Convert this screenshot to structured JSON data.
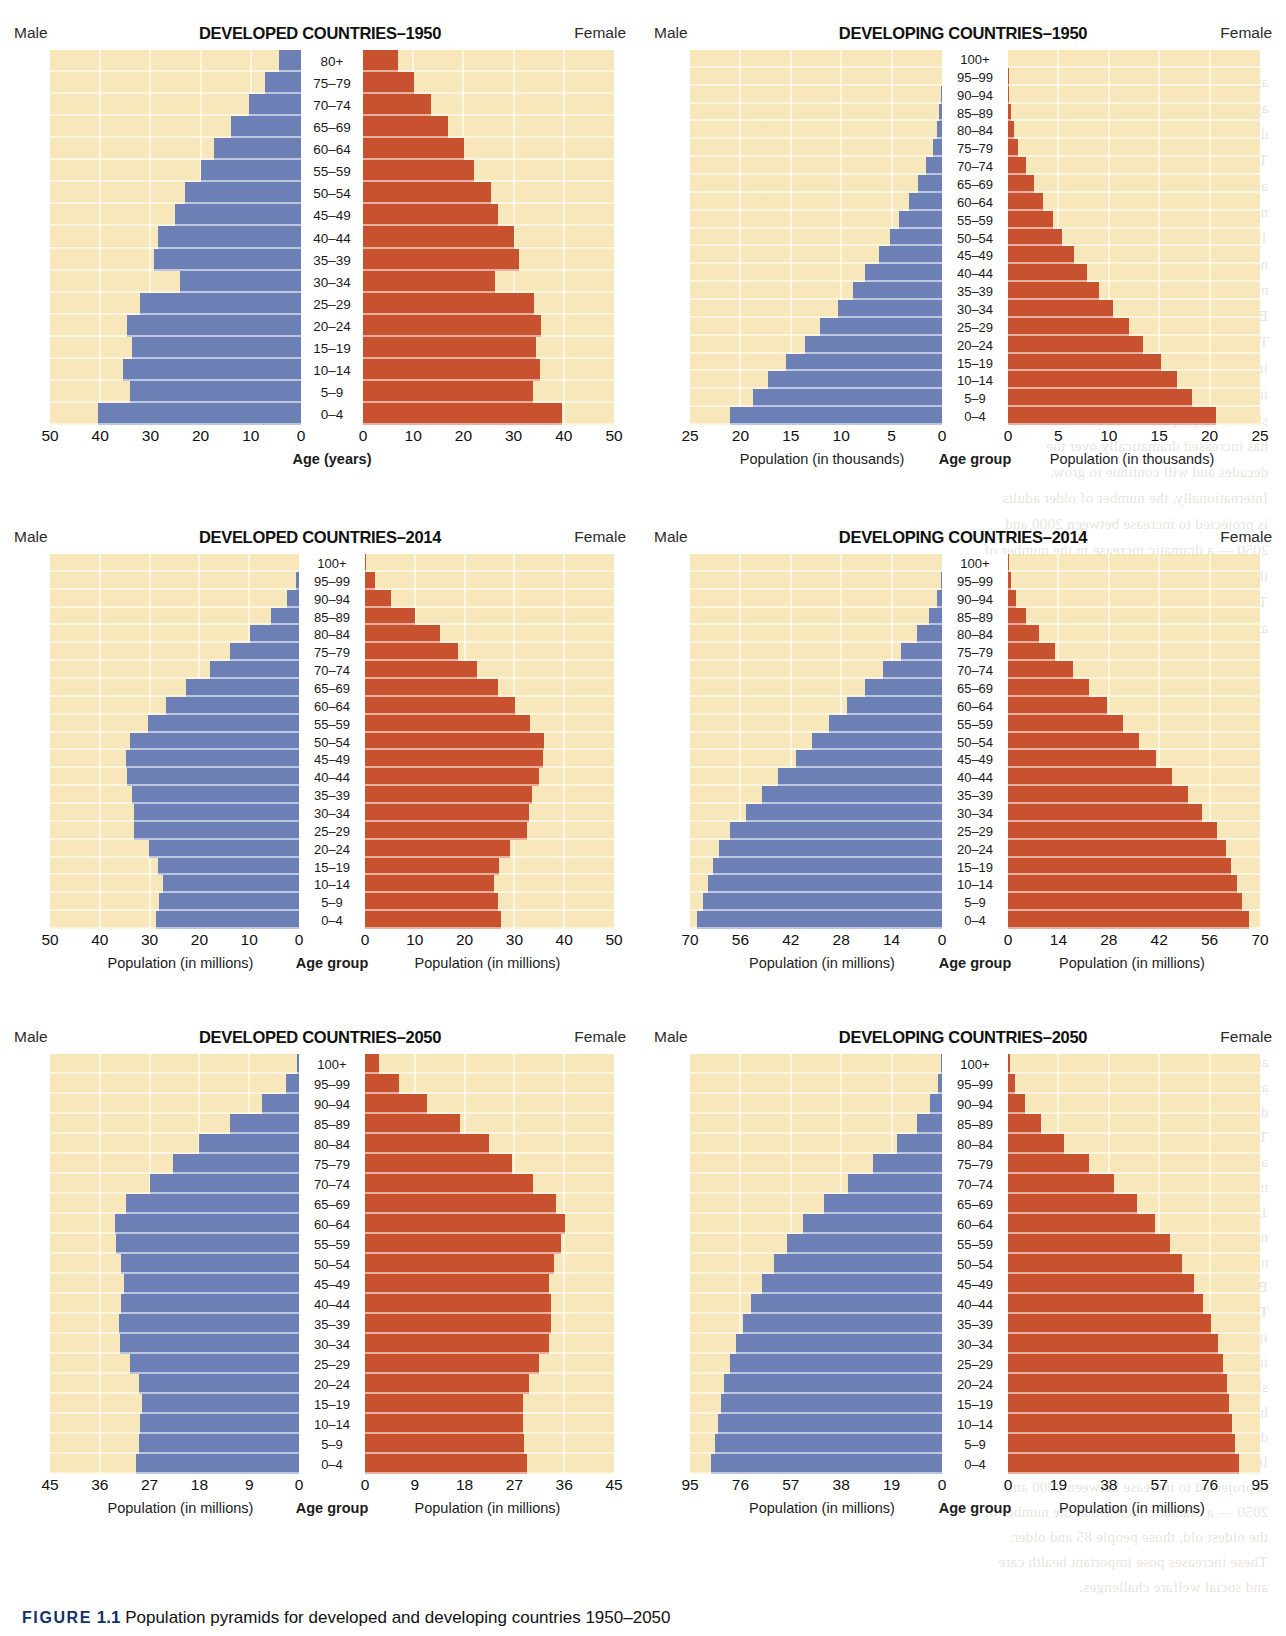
{
  "figure": {
    "label": "FIGURE",
    "number": "1.1",
    "caption": "Population pyramids for developed and developing countries 1950–2050"
  },
  "colors": {
    "male_bar": "#6c80b6",
    "female_bar": "#c8522f",
    "plot_background": "#f7e6b8",
    "gridline": "#fdf7e2",
    "age_column": "#ffffff"
  },
  "common": {
    "male_label": "Male",
    "female_label": "Female",
    "age_group_label": "Age group"
  },
  "chart_data": [
    {
      "id": "developed-1950",
      "type": "bar",
      "title": "DEVELOPED COUNTRIES–1950",
      "subtype": "population-pyramid",
      "left_label": "Male",
      "right_label": "Female",
      "center_axis_label": "Age (years)",
      "xlabel_left": "",
      "xlabel_right": "",
      "units": "",
      "xlim": [
        0,
        50
      ],
      "xticks": [
        50,
        40,
        30,
        20,
        10,
        0
      ],
      "xticks_right": [
        0,
        10,
        20,
        30,
        40,
        50
      ],
      "grid": true,
      "categories": [
        "80+",
        "75–79",
        "70–74",
        "65–69",
        "60–64",
        "55–59",
        "50–54",
        "45–49",
        "40–44",
        "35–39",
        "30–34",
        "25–29",
        "20–24",
        "15–19",
        "10–14",
        "5–9",
        "0–4"
      ],
      "series": [
        {
          "name": "Male",
          "values": [
            4.3,
            7.1,
            10.4,
            13.9,
            17.3,
            19.9,
            23.2,
            25.1,
            28.5,
            29.2,
            24.1,
            32.0,
            34.6,
            33.6,
            35.5,
            34.0,
            40.4
          ]
        },
        {
          "name": "Female",
          "values": [
            7.0,
            10.1,
            13.6,
            17.0,
            20.1,
            22.2,
            25.4,
            26.8,
            30.0,
            31.0,
            26.3,
            34.0,
            35.5,
            34.5,
            35.3,
            33.8,
            39.6
          ]
        }
      ]
    },
    {
      "id": "developing-1950",
      "type": "bar",
      "title": "DEVELOPING COUNTRIES–1950",
      "subtype": "population-pyramid",
      "left_label": "Male",
      "right_label": "Female",
      "center_axis_label": "Age group",
      "xlabel_left": "Population (in thousands)",
      "xlabel_right": "Population (in thousands)",
      "units": "thousands",
      "xlim": [
        0,
        25
      ],
      "xticks": [
        25,
        20,
        15,
        10,
        5,
        0
      ],
      "xticks_right": [
        0,
        5,
        10,
        15,
        20,
        25
      ],
      "grid": true,
      "categories": [
        "100+",
        "95–99",
        "90–94",
        "85–89",
        "80–84",
        "75–79",
        "70–74",
        "65–69",
        "60–64",
        "55–59",
        "50–54",
        "45–49",
        "40–44",
        "35–39",
        "30–34",
        "25–29",
        "20–24",
        "15–19",
        "10–14",
        "5–9",
        "0–4"
      ],
      "series": [
        {
          "name": "Male",
          "values": [
            0.0,
            0.05,
            0.1,
            0.25,
            0.5,
            0.9,
            1.6,
            2.4,
            3.3,
            4.3,
            5.2,
            6.3,
            7.6,
            8.8,
            10.3,
            12.1,
            13.6,
            15.5,
            17.3,
            18.8,
            21.0
          ]
        },
        {
          "name": "Female",
          "values": [
            0.0,
            0.05,
            0.12,
            0.3,
            0.6,
            1.0,
            1.8,
            2.6,
            3.5,
            4.5,
            5.4,
            6.5,
            7.8,
            9.0,
            10.4,
            12.0,
            13.4,
            15.2,
            16.8,
            18.3,
            20.6
          ]
        }
      ]
    },
    {
      "id": "developed-2014",
      "type": "bar",
      "title": "DEVELOPED COUNTRIES–2014",
      "subtype": "population-pyramid",
      "left_label": "Male",
      "right_label": "Female",
      "center_axis_label": "Age group",
      "xlabel_left": "Population (in millions)",
      "xlabel_right": "Population (in millions)",
      "units": "millions",
      "xlim": [
        0,
        50
      ],
      "xticks": [
        50,
        40,
        30,
        20,
        10,
        0
      ],
      "xticks_right": [
        0,
        10,
        20,
        30,
        40,
        50
      ],
      "grid": true,
      "categories": [
        "100+",
        "95–99",
        "90–94",
        "85–89",
        "80–84",
        "75–79",
        "70–74",
        "65–69",
        "60–64",
        "55–59",
        "50–54",
        "45–49",
        "40–44",
        "35–39",
        "30–34",
        "25–29",
        "20–24",
        "15–19",
        "10–14",
        "5–9",
        "0–4"
      ],
      "series": [
        {
          "name": "Male",
          "values": [
            0.1,
            0.7,
            2.4,
            5.6,
            9.8,
            13.8,
            17.8,
            22.6,
            26.8,
            30.3,
            33.9,
            34.8,
            34.6,
            33.6,
            33.2,
            33.2,
            30.2,
            28.3,
            27.3,
            28.1,
            28.7
          ]
        },
        {
          "name": "Female",
          "values": [
            0.3,
            2.0,
            5.3,
            10.1,
            15.0,
            18.7,
            22.5,
            26.8,
            30.2,
            33.1,
            35.9,
            35.8,
            35.0,
            33.5,
            32.9,
            32.6,
            29.2,
            27.0,
            26.0,
            26.7,
            27.3
          ]
        }
      ]
    },
    {
      "id": "developing-2014",
      "type": "bar",
      "title": "DEVELOPING COUNTRIES–2014",
      "subtype": "population-pyramid",
      "left_label": "Male",
      "right_label": "Female",
      "center_axis_label": "Age group",
      "xlabel_left": "Population (in millions)",
      "xlabel_right": "Population (in millions)",
      "units": "millions",
      "xlim": [
        0,
        70
      ],
      "xticks": [
        70,
        56,
        42,
        28,
        14,
        0
      ],
      "xticks_right": [
        0,
        14,
        28,
        42,
        56,
        70
      ],
      "grid": true,
      "categories": [
        "100+",
        "95–99",
        "90–94",
        "85–89",
        "80–84",
        "75–79",
        "70–74",
        "65–69",
        "60–64",
        "55–59",
        "50–54",
        "45–49",
        "40–44",
        "35–39",
        "30–34",
        "25–29",
        "20–24",
        "15–19",
        "10–14",
        "5–9",
        "0–4"
      ],
      "series": [
        {
          "name": "Male",
          "values": [
            0.1,
            0.4,
            1.4,
            3.5,
            7.0,
            11.5,
            16.5,
            21.5,
            26.5,
            31.5,
            36.0,
            40.5,
            45.5,
            50.0,
            54.5,
            59.0,
            62.0,
            63.5,
            65.0,
            66.5,
            68.0
          ]
        },
        {
          "name": "Female",
          "values": [
            0.2,
            0.7,
            2.2,
            5.0,
            8.5,
            13.0,
            18.0,
            22.5,
            27.5,
            32.0,
            36.5,
            41.0,
            45.5,
            50.0,
            54.0,
            58.0,
            60.5,
            62.0,
            63.5,
            65.0,
            67.0
          ]
        }
      ]
    },
    {
      "id": "developed-2050",
      "type": "bar",
      "title": "DEVELOPED COUNTRIES–2050",
      "subtype": "population-pyramid",
      "left_label": "Male",
      "right_label": "Female",
      "center_axis_label": "Age group",
      "xlabel_left": "Population (in millions)",
      "xlabel_right": "Population (in millions)",
      "units": "millions",
      "xlim": [
        0,
        45
      ],
      "xticks": [
        45,
        36,
        27,
        18,
        9,
        0
      ],
      "xticks_right": [
        0,
        9,
        18,
        27,
        36,
        45
      ],
      "grid": true,
      "categories": [
        "100+",
        "95–99",
        "90–94",
        "85–89",
        "80–84",
        "75–79",
        "70–74",
        "65–69",
        "60–64",
        "55–59",
        "50–54",
        "45–49",
        "40–44",
        "35–39",
        "30–34",
        "25–29",
        "20–24",
        "15–19",
        "10–14",
        "5–9",
        "0–4"
      ],
      "series": [
        {
          "name": "Male",
          "values": [
            0.3,
            2.3,
            6.6,
            12.5,
            18.0,
            22.8,
            26.9,
            31.2,
            33.3,
            33.0,
            32.2,
            31.7,
            32.2,
            32.6,
            32.4,
            30.6,
            29.0,
            28.4,
            28.7,
            29.0,
            29.5
          ]
        },
        {
          "name": "Female",
          "values": [
            2.6,
            6.2,
            11.2,
            17.1,
            22.4,
            26.6,
            30.4,
            34.6,
            36.2,
            35.4,
            34.2,
            33.3,
            33.6,
            33.6,
            33.3,
            31.5,
            29.6,
            28.5,
            28.5,
            28.8,
            29.2
          ]
        }
      ]
    },
    {
      "id": "developing-2050",
      "type": "bar",
      "title": "DEVELOPING COUNTRIES–2050",
      "subtype": "population-pyramid",
      "left_label": "Male",
      "right_label": "Female",
      "center_axis_label": "Age group",
      "xlabel_left": "Population (in millions)",
      "xlabel_right": "Population (in millions)",
      "units": "millions",
      "xlim": [
        0,
        95
      ],
      "xticks": [
        95,
        76,
        57,
        38,
        19,
        0
      ],
      "xticks_right": [
        0,
        19,
        38,
        57,
        76,
        95
      ],
      "grid": true,
      "categories": [
        "100+",
        "95–99",
        "90–94",
        "85–89",
        "80–84",
        "75–79",
        "70–74",
        "65–69",
        "60–64",
        "55–59",
        "50–54",
        "45–49",
        "40–44",
        "35–39",
        "30–34",
        "25–29",
        "20–24",
        "15–19",
        "10–14",
        "5–9",
        "0–4"
      ],
      "series": [
        {
          "name": "Male",
          "values": [
            0.3,
            1.6,
            4.4,
            9.5,
            17.0,
            26.0,
            35.5,
            44.5,
            52.5,
            58.5,
            63.5,
            68.0,
            72.0,
            75.0,
            77.5,
            80.0,
            82.0,
            83.5,
            84.5,
            85.5,
            87.0
          ]
        },
        {
          "name": "Female",
          "values": [
            0.6,
            2.6,
            6.4,
            12.5,
            21.0,
            30.5,
            40.0,
            48.5,
            55.5,
            61.0,
            65.5,
            70.0,
            73.5,
            76.5,
            79.0,
            81.0,
            82.5,
            83.5,
            84.5,
            85.5,
            87.0
          ]
        }
      ]
    }
  ],
  "bleed_text": [
    "and have expanded in the top segments of the",
    "age pyramid. This trend is evident in both the",
    "developed and developing countries.",
    "The increase in life expectancy has",
    "also been accompanied by an increase in the",
    "number of centenarians, people who are",
    "100 years or older. It is estimated that the",
    "number of centenarians in the United States",
    "numbered 53,364 in 2010 (U.S. Census",
    "Bureau, 2012).",
    "The world population is aging, with",
    "increased percentages of older adults",
    "in nearly every country. As the figure",
    "shows, the proportion of older adults",
    "has increased dramatically over the",
    "decades and will continue to grow.",
    "Internationally, the number of older adults",
    "is projected to increase between 2000 and",
    "2050 — a dramatic increase in the number of",
    "the oldest old, those people 85 and older.",
    "These increases pose important health care",
    "and social welfare challenges."
  ]
}
